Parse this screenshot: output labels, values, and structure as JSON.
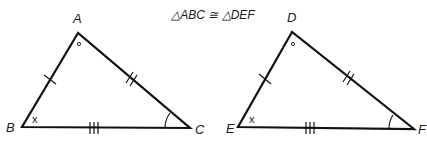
{
  "title": "△ABC ≅ △DEF",
  "triangles": [
    {
      "name": "ABC",
      "vertices": {
        "top": "A",
        "left": "B",
        "right": "C"
      },
      "angle_marks": {
        "top": "°",
        "left": "x",
        "right": "arc"
      },
      "side_marks": {
        "left": 1,
        "right": 2,
        "bottom": 3
      }
    },
    {
      "name": "DEF",
      "vertices": {
        "top": "D",
        "left": "E",
        "right": "F"
      },
      "angle_marks": {
        "top": "°",
        "left": "x",
        "right": "arc"
      },
      "side_marks": {
        "left": 1,
        "right": 2,
        "bottom": 3
      }
    }
  ],
  "labels": {
    "A": "A",
    "B": "B",
    "C": "C",
    "D": "D",
    "E": "E",
    "F": "F",
    "x1": "x",
    "x2": "x"
  }
}
